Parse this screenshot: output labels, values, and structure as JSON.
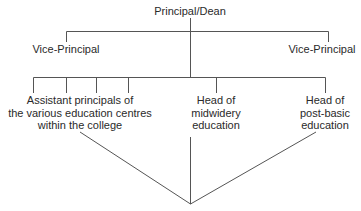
{
  "diagram": {
    "type": "org-chart",
    "root": {
      "label": "Principal/Dean"
    },
    "level1": [
      {
        "label": "Vice-Principal",
        "side": "left"
      },
      {
        "label": "Vice-Principal",
        "side": "right"
      }
    ],
    "level2": [
      {
        "lines": [
          "Assistant principals of",
          "the various education centres",
          "within the college"
        ]
      },
      {
        "lines": [
          "Head of",
          "midwidery",
          "education"
        ]
      },
      {
        "lines": [
          "Head of",
          "post-basic",
          "education"
        ]
      }
    ],
    "line_color": "#555555"
  }
}
